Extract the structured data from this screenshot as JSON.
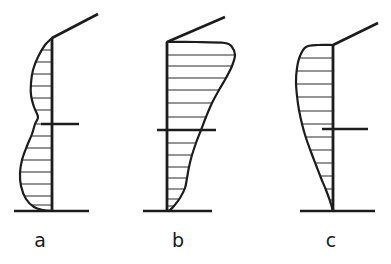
{
  "figure": {
    "type": "technical-line-diagram",
    "background_color": "#ffffff",
    "ink_color": "#1c1c1c",
    "width": 391,
    "height": 264
  },
  "panels": [
    {
      "id": "a",
      "label": "a",
      "label_x": 40,
      "label_y": 247,
      "profile_shape": "double-bulge S-curve opening to the left",
      "column_x": 52,
      "column_top_y": 38,
      "column_bottom_y": 211,
      "base_line": {
        "x1": 14,
        "y1": 211,
        "x2": 89,
        "y2": 211,
        "width": 2.6
      },
      "upper_beam": {
        "x1": 52,
        "y1": 38,
        "x2": 98,
        "y2": 14,
        "width": 2.6
      },
      "mid_tick": {
        "x1": 41,
        "y1": 124,
        "x2": 79,
        "y2": 124,
        "width": 2.6
      },
      "curve_points": [
        [
          52,
          38
        ],
        [
          45,
          45
        ],
        [
          38,
          57
        ],
        [
          33,
          70
        ],
        [
          31,
          83
        ],
        [
          31,
          95
        ],
        [
          34,
          107
        ],
        [
          38,
          117
        ],
        [
          35,
          124
        ],
        [
          32,
          134
        ],
        [
          27,
          146
        ],
        [
          22,
          160
        ],
        [
          20,
          173
        ],
        [
          21,
          186
        ],
        [
          26,
          199
        ],
        [
          34,
          207
        ],
        [
          43,
          210
        ],
        [
          52,
          211
        ]
      ],
      "hatch_rows": [
        {
          "y": 50,
          "x_outer": 41
        },
        {
          "y": 62,
          "x_outer": 35
        },
        {
          "y": 74,
          "x_outer": 32
        },
        {
          "y": 86,
          "x_outer": 31
        },
        {
          "y": 98,
          "x_outer": 32
        },
        {
          "y": 110,
          "x_outer": 35
        },
        {
          "y": 124,
          "x_outer": 35
        },
        {
          "y": 136,
          "x_outer": 31
        },
        {
          "y": 148,
          "x_outer": 26
        },
        {
          "y": 160,
          "x_outer": 22
        },
        {
          "y": 172,
          "x_outer": 20
        },
        {
          "y": 184,
          "x_outer": 21
        },
        {
          "y": 196,
          "x_outer": 24
        },
        {
          "y": 205,
          "x_outer": 32
        }
      ]
    },
    {
      "id": "b",
      "label": "b",
      "label_x": 178,
      "label_y": 247,
      "profile_shape": "tapered triangular wedge to the right, widest at the top",
      "column_x": 167,
      "column_top_y": 42,
      "column_bottom_y": 211,
      "base_line": {
        "x1": 143,
        "y1": 211,
        "x2": 212,
        "y2": 211,
        "width": 2.6
      },
      "upper_beam": {
        "x1": 167,
        "y1": 42,
        "x2": 225,
        "y2": 17,
        "width": 2.6
      },
      "mid_tick": {
        "x1": 157,
        "y1": 130,
        "x2": 216,
        "y2": 130,
        "width": 2.6
      },
      "curve_points": [
        [
          167,
          42
        ],
        [
          196,
          42
        ],
        [
          225,
          43
        ],
        [
          232,
          47
        ],
        [
          235,
          55
        ],
        [
          232,
          66
        ],
        [
          226,
          78
        ],
        [
          219,
          90
        ],
        [
          212,
          103
        ],
        [
          206,
          117
        ],
        [
          201,
          130
        ],
        [
          196,
          143
        ],
        [
          192,
          155
        ],
        [
          189,
          167
        ],
        [
          187,
          178
        ],
        [
          185,
          188
        ],
        [
          180,
          198
        ],
        [
          174,
          206
        ],
        [
          169,
          211
        ]
      ],
      "hatch_rows": [
        {
          "y": 55,
          "x_outer": 234
        },
        {
          "y": 66,
          "x_outer": 232
        },
        {
          "y": 78,
          "x_outer": 226
        },
        {
          "y": 90,
          "x_outer": 219
        },
        {
          "y": 103,
          "x_outer": 212
        },
        {
          "y": 117,
          "x_outer": 206
        },
        {
          "y": 130,
          "x_outer": 201
        },
        {
          "y": 143,
          "x_outer": 196
        },
        {
          "y": 155,
          "x_outer": 192
        },
        {
          "y": 167,
          "x_outer": 189
        },
        {
          "y": 178,
          "x_outer": 187
        },
        {
          "y": 189,
          "x_outer": 184
        },
        {
          "y": 199,
          "x_outer": 179
        },
        {
          "y": 206,
          "x_outer": 174
        }
      ]
    },
    {
      "id": "c",
      "label": "c",
      "label_x": 331,
      "label_y": 247,
      "profile_shape": "smooth convex bulge to the left, widest at upper middle",
      "column_x": 333,
      "column_top_y": 45,
      "column_bottom_y": 211,
      "base_line": {
        "x1": 300,
        "y1": 211,
        "x2": 375,
        "y2": 211,
        "width": 2.6
      },
      "upper_beam": {
        "x1": 333,
        "y1": 45,
        "x2": 378,
        "y2": 23,
        "width": 2.6
      },
      "mid_tick": {
        "x1": 322,
        "y1": 129,
        "x2": 368,
        "y2": 129,
        "width": 2.6
      },
      "curve_points": [
        [
          333,
          45
        ],
        [
          318,
          45
        ],
        [
          306,
          47
        ],
        [
          300,
          56
        ],
        [
          297,
          68
        ],
        [
          296,
          82
        ],
        [
          297,
          96
        ],
        [
          299,
          110
        ],
        [
          302,
          124
        ],
        [
          306,
          138
        ],
        [
          311,
          152
        ],
        [
          316,
          165
        ],
        [
          321,
          178
        ],
        [
          326,
          190
        ],
        [
          330,
          201
        ],
        [
          333,
          211
        ]
      ],
      "hatch_rows": [
        {
          "y": 58,
          "x_outer": 300
        },
        {
          "y": 71,
          "x_outer": 297
        },
        {
          "y": 84,
          "x_outer": 296
        },
        {
          "y": 97,
          "x_outer": 297
        },
        {
          "y": 111,
          "x_outer": 299
        },
        {
          "y": 124,
          "x_outer": 302
        },
        {
          "y": 137,
          "x_outer": 306
        },
        {
          "y": 150,
          "x_outer": 310
        },
        {
          "y": 163,
          "x_outer": 315
        },
        {
          "y": 176,
          "x_outer": 320
        },
        {
          "y": 189,
          "x_outer": 326
        },
        {
          "y": 200,
          "x_outer": 330
        }
      ]
    }
  ]
}
